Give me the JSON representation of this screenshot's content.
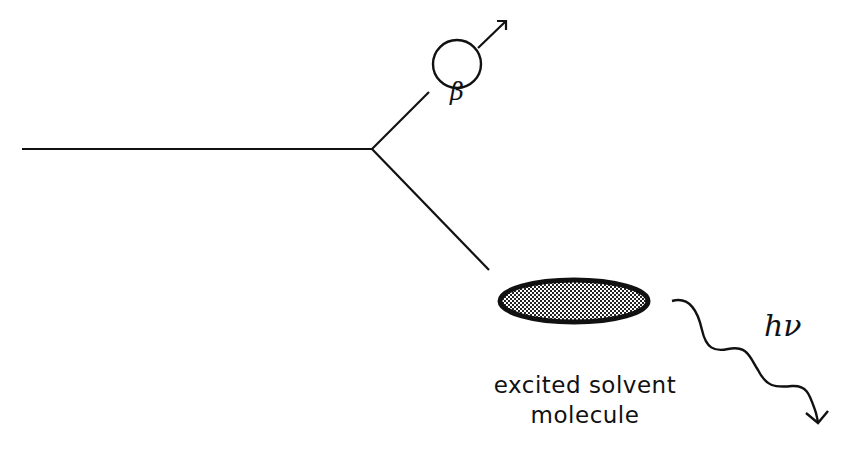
{
  "diagram": {
    "type": "particle track / radiation interaction schematic",
    "particle_label": "β",
    "photon_label": "hν",
    "target_label_line1": "excited solvent",
    "target_label_line2": "molecule",
    "colors": {
      "stroke": "#111111",
      "background": "#ffffff",
      "stipple_fill": "#9a9a9a"
    }
  }
}
